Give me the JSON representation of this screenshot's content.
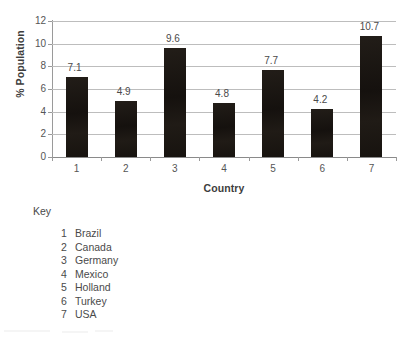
{
  "chart_data": {
    "type": "bar",
    "title": "",
    "xlabel": "Country",
    "ylabel": "% Population",
    "categories": [
      "1",
      "2",
      "3",
      "4",
      "5",
      "6",
      "7"
    ],
    "values": [
      7.1,
      4.9,
      9.6,
      4.8,
      7.7,
      4.2,
      10.7
    ],
    "data_labels": [
      "7.1",
      "4.9",
      "9.6",
      "4.8",
      "7.7",
      "4.2",
      "10.7"
    ],
    "ylim": [
      0,
      12
    ],
    "ytick_labels": [
      "0",
      "2",
      "4",
      "6",
      "8",
      "10",
      "12"
    ],
    "ytick_values": [
      0,
      2,
      4,
      6,
      8,
      10,
      12
    ],
    "grid": "horizontal",
    "legend_position": "below-chart",
    "bar_color": "#1a1612",
    "gridline_color": "#bdbdbd",
    "axis_color": "#9a9a9a",
    "text_color": "#4a4a4a"
  },
  "key": {
    "heading": "Key",
    "entries": [
      {
        "number": "1",
        "country": "Brazil"
      },
      {
        "number": "2",
        "country": "Canada"
      },
      {
        "number": "3",
        "country": "Germany"
      },
      {
        "number": "4",
        "country": "Mexico"
      },
      {
        "number": "5",
        "country": "Holland"
      },
      {
        "number": "6",
        "country": "Turkey"
      },
      {
        "number": "7",
        "country": "USA"
      }
    ]
  }
}
